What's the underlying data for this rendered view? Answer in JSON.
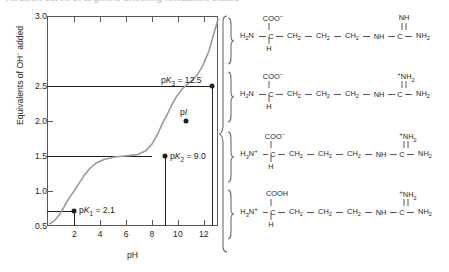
{
  "figure": {
    "cut_caption": "Titration curve of arginine showing ionization states",
    "top_strip_visible": true
  },
  "chart_data": {
    "type": "line",
    "title": "",
    "xlabel": "pH",
    "ylabel": "Equivalents of OH− added",
    "ylabel_plain": "Equivalents of OH added",
    "xlim": [
      0,
      13.2
    ],
    "ylim": [
      0,
      3.0
    ],
    "grid": false,
    "legend": "none",
    "xticks": [
      2,
      4,
      6,
      8,
      10,
      12
    ],
    "xtick_labels": [
      "2",
      "4",
      "6",
      "8",
      "10",
      "12"
    ],
    "yticks": [
      0.5,
      1.0,
      1.5,
      2.0,
      2.5,
      3.0
    ],
    "ytick_labels": [
      "0.5",
      "1.0",
      "1.5",
      "2.0",
      "2.5",
      "3.0"
    ],
    "x": [
      0.2,
      0.6,
      1.0,
      1.4,
      1.7,
      2.1,
      2.5,
      2.9,
      3.3,
      3.8,
      4.4,
      5.2,
      6.0,
      7.0,
      7.6,
      8.1,
      8.5,
      8.8,
      9.0,
      9.3,
      9.6,
      10.0,
      10.4,
      10.8,
      11.2,
      11.6,
      12.0,
      12.5,
      12.9,
      13.2
    ],
    "y": [
      0.03,
      0.08,
      0.17,
      0.3,
      0.4,
      0.5,
      0.62,
      0.73,
      0.82,
      0.9,
      0.95,
      0.985,
      1.0,
      1.02,
      1.07,
      1.17,
      1.3,
      1.42,
      1.5,
      1.6,
      1.72,
      1.85,
      1.95,
      2.02,
      2.08,
      2.16,
      2.28,
      2.5,
      2.76,
      2.95
    ],
    "markers": [
      {
        "name": "pK1",
        "label": "pK1 = 2.1",
        "label_prefix": "pK",
        "label_sub": "1",
        "label_value": "= 2.1",
        "x": 2.1,
        "y": 0.5
      },
      {
        "name": "pK2",
        "label": "pK2 = 9.0",
        "label_prefix": "pK",
        "label_sub": "2",
        "label_value": "= 9.0",
        "x": 9.0,
        "y": 1.5
      },
      {
        "name": "pI",
        "label": "pI",
        "label_prefix": "p",
        "label_sub": "",
        "label_value": "I",
        "x": 10.76,
        "y": 2.0
      },
      {
        "name": "pK3",
        "label": "pK3 = 12.5",
        "label_prefix": "pK",
        "label_sub": "3",
        "label_value": "= 12.5",
        "x": 12.5,
        "y": 2.5
      }
    ],
    "guides": [
      {
        "from_y": 0.5,
        "to_x": 2.1
      },
      {
        "from_y": 1.5,
        "to_x": 9.0
      },
      {
        "from_y": 2.5,
        "to_x": 12.5
      }
    ]
  },
  "structures": [
    {
      "id": "arginine-fully-deprotonated",
      "alpha_amino": "H₂N",
      "alpha_amino_charge": "",
      "carboxyl_top": "COO",
      "carboxyl_top_charge": "−",
      "alpha_h": "H",
      "chain": [
        "CH₂",
        "CH₂",
        "CH₂",
        "NH"
      ],
      "guanidino_center": "C",
      "guanidino_top": "NH",
      "guanidino_top_charge": "",
      "guanidino_right": "NH₂",
      "double_bond_top": true
    },
    {
      "id": "arginine-guanidinium-protonated",
      "alpha_amino": "H₂N",
      "alpha_amino_charge": "",
      "carboxyl_top": "COO",
      "carboxyl_top_charge": "−",
      "alpha_h": "H",
      "chain": [
        "CH₂",
        "CH₂",
        "CH₂",
        "NH"
      ],
      "guanidino_center": "C",
      "guanidino_top": "NH₂",
      "guanidino_top_charge": "+",
      "guanidino_right": "NH₂",
      "double_bond_top": true
    },
    {
      "id": "arginine-zwitterion",
      "alpha_amino": "H₃N",
      "alpha_amino_charge": "+",
      "carboxyl_top": "COO",
      "carboxyl_top_charge": "−",
      "alpha_h": "H",
      "chain": [
        "CH₂",
        "CH₂",
        "CH₂",
        "NH"
      ],
      "guanidino_center": "C",
      "guanidino_top": "NH₂",
      "guanidino_top_charge": "+",
      "guanidino_right": "NH₂",
      "double_bond_top": true
    },
    {
      "id": "arginine-fully-protonated",
      "alpha_amino": "H₃N",
      "alpha_amino_charge": "+",
      "carboxyl_top": "COOH",
      "carboxyl_top_charge": "",
      "alpha_h": "H",
      "chain": [
        "CH₂",
        "CH₂",
        "CH₂",
        "NH"
      ],
      "guanidino_center": "C",
      "guanidino_top": "NH₂",
      "guanidino_top_charge": "+",
      "guanidino_right": "NH₂",
      "double_bond_top": true
    }
  ],
  "colors": {
    "axis": "#58585a",
    "curve": "#9b9b9b",
    "text": "#231f20",
    "marker": "#231f20",
    "brace": "#6d6e71",
    "background": "#ffffff"
  }
}
